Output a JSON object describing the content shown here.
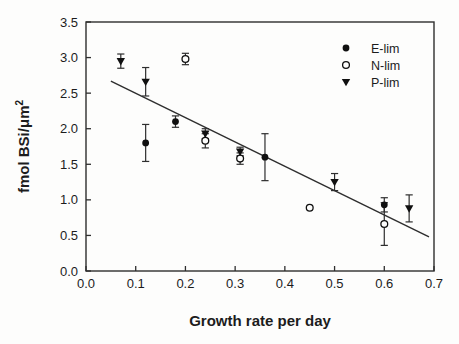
{
  "figure": {
    "background": "#fdfdfc",
    "frame_color": "#2e2e2e",
    "marker_color": "#101010",
    "text_color": "#1c1c1c"
  },
  "chart_data": {
    "type": "scatter",
    "title": "",
    "xlabel": "Growth rate per day",
    "ylabel": "fmol BSi/μm²",
    "ylabel_main": "fmol BSi/μm",
    "ylabel_sup": "2",
    "xlim": [
      0.0,
      0.7
    ],
    "ylim": [
      0.0,
      3.5
    ],
    "x_ticks": [
      "0.0",
      "0.1",
      "0.2",
      "0.3",
      "0.4",
      "0.5",
      "0.6",
      "0.7"
    ],
    "y_ticks": [
      "0.0",
      "0.5",
      "1.0",
      "1.5",
      "2.0",
      "2.5",
      "3.0",
      "3.5"
    ],
    "grid": false,
    "legend_position": "upper-right-inside",
    "series": [
      {
        "name": "E-lim",
        "marker": "filled-circle",
        "points": [
          {
            "x": 0.12,
            "y": 1.8,
            "err": 0.26
          },
          {
            "x": 0.18,
            "y": 2.1,
            "err": 0.08
          },
          {
            "x": 0.36,
            "y": 1.6,
            "err": 0.33
          },
          {
            "x": 0.6,
            "y": 0.93,
            "err": 0.1
          }
        ]
      },
      {
        "name": "N-lim",
        "marker": "open-circle",
        "points": [
          {
            "x": 0.2,
            "y": 2.98,
            "err": 0.08
          },
          {
            "x": 0.24,
            "y": 1.83,
            "err": 0.1
          },
          {
            "x": 0.31,
            "y": 1.58,
            "err": 0.08
          },
          {
            "x": 0.45,
            "y": 0.89,
            "err": 0
          },
          {
            "x": 0.6,
            "y": 0.66,
            "err": 0.3
          }
        ]
      },
      {
        "name": "P-lim",
        "marker": "filled-triangle",
        "points": [
          {
            "x": 0.07,
            "y": 2.95,
            "err": 0.1
          },
          {
            "x": 0.12,
            "y": 2.66,
            "err": 0.2
          },
          {
            "x": 0.24,
            "y": 1.93,
            "err": 0.07
          },
          {
            "x": 0.31,
            "y": 1.68,
            "err": 0.06
          },
          {
            "x": 0.5,
            "y": 1.25,
            "err": 0.12
          },
          {
            "x": 0.65,
            "y": 0.88,
            "err": 0.19
          }
        ]
      }
    ],
    "trend_line": {
      "x1": 0.05,
      "y1": 2.67,
      "x2": 0.69,
      "y2": 0.48
    }
  },
  "legend": {
    "items": [
      {
        "label": "E-lim",
        "marker": "filled-circle"
      },
      {
        "label": "N-lim",
        "marker": "open-circle"
      },
      {
        "label": "P-lim",
        "marker": "filled-triangle"
      }
    ]
  }
}
